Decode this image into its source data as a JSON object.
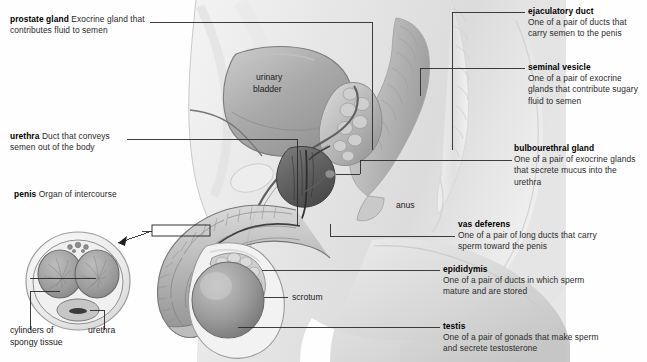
{
  "figure": {
    "background_color": "#fefefe",
    "ink_color": "#1b1b1b",
    "leader_line_color": "#2a2a2a"
  },
  "callouts": {
    "prostate_gland": {
      "term": "prostate gland",
      "desc": "Exocrine gland that contributes fluid to semen"
    },
    "urethra": {
      "term": "urethra",
      "desc": "Duct that conveys semen out of the body"
    },
    "penis": {
      "term": "penis",
      "desc": "Organ of intercourse"
    },
    "ejaculatory_duct": {
      "term": "ejaculatory duct",
      "desc": "One of a pair of ducts that carry semen to the penis"
    },
    "seminal_vesicle": {
      "term": "seminal vesicle",
      "desc": "One of a pair of exocrine glands that contribute sugary fluid to semen"
    },
    "bulbourethral_gland": {
      "term": "bulbourethral gland",
      "desc": "One of a pair of exocrine glands that secrete mucus into the urethra"
    },
    "vas_deferens": {
      "term": "vas deferens",
      "desc": "One of a pair of long ducts that carry sperm toward the penis"
    },
    "epididymis": {
      "term": "epididymis",
      "desc": "One of a pair of ducts in which sperm mature and are stored"
    },
    "testis": {
      "term": "testis",
      "desc": "One of a pair of gonads that make sperm and secrete testosterone"
    }
  },
  "inline_labels": {
    "urinary_bladder_line1": "urinary",
    "urinary_bladder_line2": "bladder",
    "anus": "anus",
    "scrotum": "scrotum"
  },
  "cross_section_labels": {
    "cylinders_line1": "cylinders of",
    "cylinders_line2": "spongy tissue",
    "urethra": "urethra"
  }
}
